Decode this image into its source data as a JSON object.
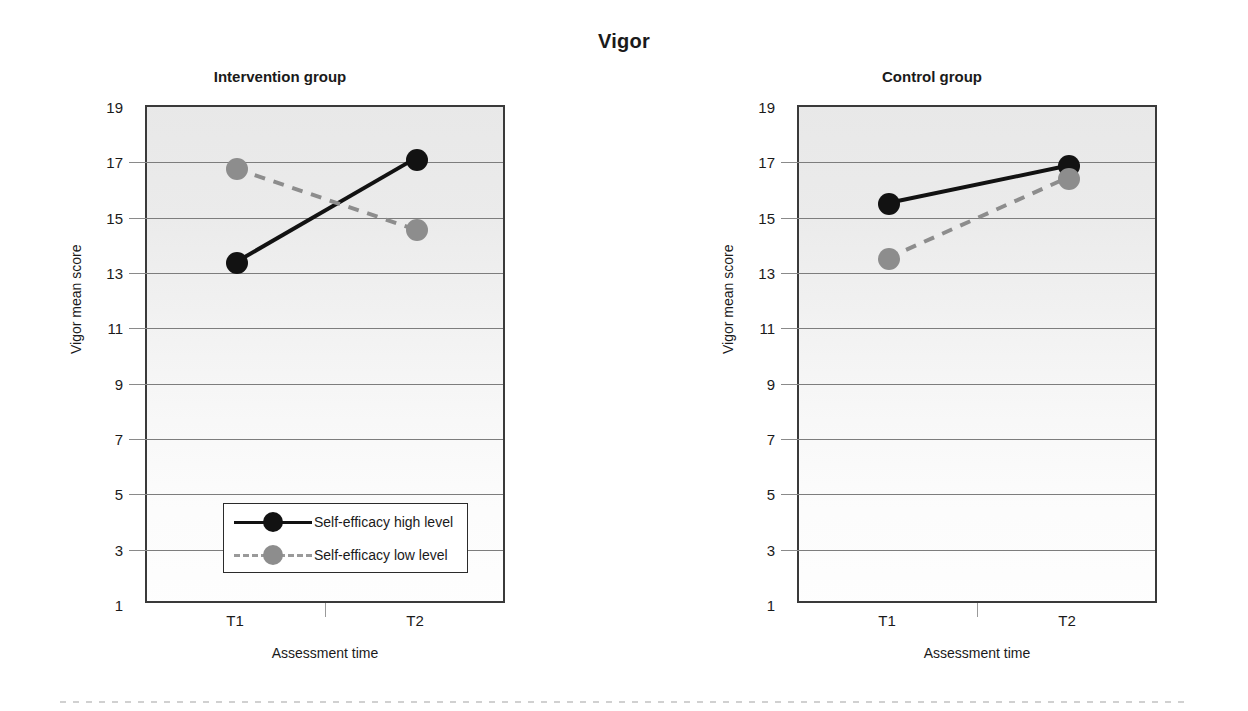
{
  "figure": {
    "title": "Vigor",
    "scan_artifact": true
  },
  "axis": {
    "y_title": "Vigor mean score",
    "x_title": "Assessment time",
    "y_ticks": [
      "19",
      "17",
      "15",
      "13",
      "11",
      "9",
      "7",
      "5",
      "3",
      "1"
    ],
    "x_ticks": [
      "T1",
      "T2"
    ]
  },
  "legend": {
    "items": [
      {
        "label": "Self-efficacy high level",
        "style": "solid",
        "color": "#121212"
      },
      {
        "label": "Self-efficacy low level",
        "style": "dashed",
        "color": "#8d8d8d"
      }
    ]
  },
  "panels": [
    {
      "title": "Intervention group"
    },
    {
      "title": "Control group"
    }
  ],
  "chart_data": [
    {
      "type": "line",
      "title": "Intervention group",
      "suptitle": "Vigor",
      "xlabel": "Assessment time",
      "ylabel": "Vigor mean score",
      "x": [
        "T1",
        "T2"
      ],
      "ylim": [
        1,
        19
      ],
      "ytick_step": 2,
      "grid": "horizontal",
      "legend_position": "lower center inside axes",
      "series": [
        {
          "name": "Self-efficacy high level",
          "values": [
            13.35,
            17.1
          ],
          "color": "#121212",
          "linestyle": "solid",
          "marker": "filled-circle"
        },
        {
          "name": "Self-efficacy low level",
          "values": [
            16.75,
            14.55
          ],
          "color": "#8d8d8d",
          "linestyle": "dashed",
          "marker": "filled-circle"
        }
      ]
    },
    {
      "type": "line",
      "title": "Control group",
      "suptitle": "Vigor",
      "xlabel": "Assessment time",
      "ylabel": "Vigor mean score",
      "x": [
        "T1",
        "T2"
      ],
      "ylim": [
        1,
        19
      ],
      "ytick_step": 2,
      "grid": "horizontal",
      "legend_position": "none",
      "series": [
        {
          "name": "Self-efficacy high level",
          "values": [
            15.5,
            16.85
          ],
          "color": "#121212",
          "linestyle": "solid",
          "marker": "filled-circle"
        },
        {
          "name": "Self-efficacy low level",
          "values": [
            13.5,
            16.4
          ],
          "color": "#8d8d8d",
          "linestyle": "dashed",
          "marker": "filled-circle"
        }
      ]
    }
  ]
}
